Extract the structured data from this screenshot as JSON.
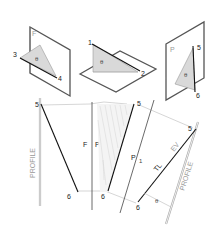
{
  "figure": {
    "type": "descriptive-geometry"
  },
  "pictorials": [
    {
      "id": "frontal-plane",
      "plane_label": "F",
      "points": [
        "3",
        "4"
      ],
      "angle_label": "θ"
    },
    {
      "id": "horizontal-plane",
      "plane_label": "",
      "points": [
        "1",
        "2"
      ],
      "angle_label": "θ"
    },
    {
      "id": "profile-plane",
      "plane_label": "P",
      "points": [
        "5",
        "6"
      ],
      "angle_label": "θ"
    }
  ],
  "orthographic": {
    "left_view": {
      "edge_label": "PROFILE",
      "point_top": "5",
      "point_bottom": "6"
    },
    "center_view": {
      "fold_left": "F",
      "fold_right": "P",
      "point_top": "5",
      "point_bottom": "6"
    },
    "aux_fold": {
      "label_p": "P",
      "label_sub": "1",
      "point_top": "5",
      "point_bottom": "6"
    },
    "right_view": {
      "edge_label": "PROFILE",
      "true_length_label": "TL",
      "edge_view_label": "EV",
      "point_top": "5",
      "point_bottom": "6",
      "angle_label": "θ"
    }
  }
}
